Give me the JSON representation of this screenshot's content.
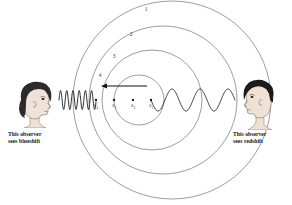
{
  "figure": {
    "type": "doppler-effect-diagram",
    "background_color": "#ffffff",
    "wavefront_color": "#5a5a5a",
    "wave_color": "#1a1a1a",
    "ink_color": "#111111"
  },
  "wavefronts": [
    {
      "label": "1",
      "label_x": 146,
      "label_y": 11,
      "cx": 172,
      "cy": 100,
      "r": 99
    },
    {
      "label": "2",
      "label_x": 131,
      "label_y": 36,
      "cx": 163,
      "cy": 100,
      "r": 74
    },
    {
      "label": "3",
      "label_x": 114,
      "label_y": 58,
      "cx": 152,
      "cy": 100,
      "r": 50
    },
    {
      "label": "4",
      "label_x": 100,
      "label_y": 77,
      "cx": 139,
      "cy": 100,
      "r": 25
    }
  ],
  "sources": [
    {
      "label": "S",
      "sub": "4",
      "x": 96,
      "y": 100
    },
    {
      "label": "S",
      "sub": "3",
      "x": 114,
      "y": 100
    },
    {
      "label": "S",
      "sub": "2",
      "x": 133,
      "y": 100
    },
    {
      "label": "S",
      "sub": "1",
      "x": 151,
      "y": 100
    }
  ],
  "motion_arrow": {
    "name": "source-motion-arrow",
    "direction": "left",
    "x_start": 147,
    "x_end": 101,
    "y": 86
  },
  "waves": {
    "left": {
      "name": "blueshifted-wave-train",
      "description": "compressed short-wavelength wave toward left observer",
      "x_start": 59,
      "x_end": 96,
      "y": 100,
      "wavelength": 6.2,
      "amplitude": 9.5
    },
    "right": {
      "name": "redshifted-wave-train",
      "description": "stretched long-wavelength wave toward right observer",
      "x_start": 151,
      "x_end": 235,
      "y": 100,
      "wavelength": 28,
      "amplitude": 11
    }
  },
  "observers": {
    "left": {
      "name": "left-observer",
      "description": "woman facing right",
      "caption": "This observer\nsees blueshift",
      "hair_color": "#2b2b2b",
      "skin_color": "#f0e2d6"
    },
    "right": {
      "name": "right-observer",
      "description": "man facing left",
      "caption": "This observer\nsees redshift",
      "hair_color": "#1c1c1c",
      "skin_color": "#efe1d4"
    }
  }
}
